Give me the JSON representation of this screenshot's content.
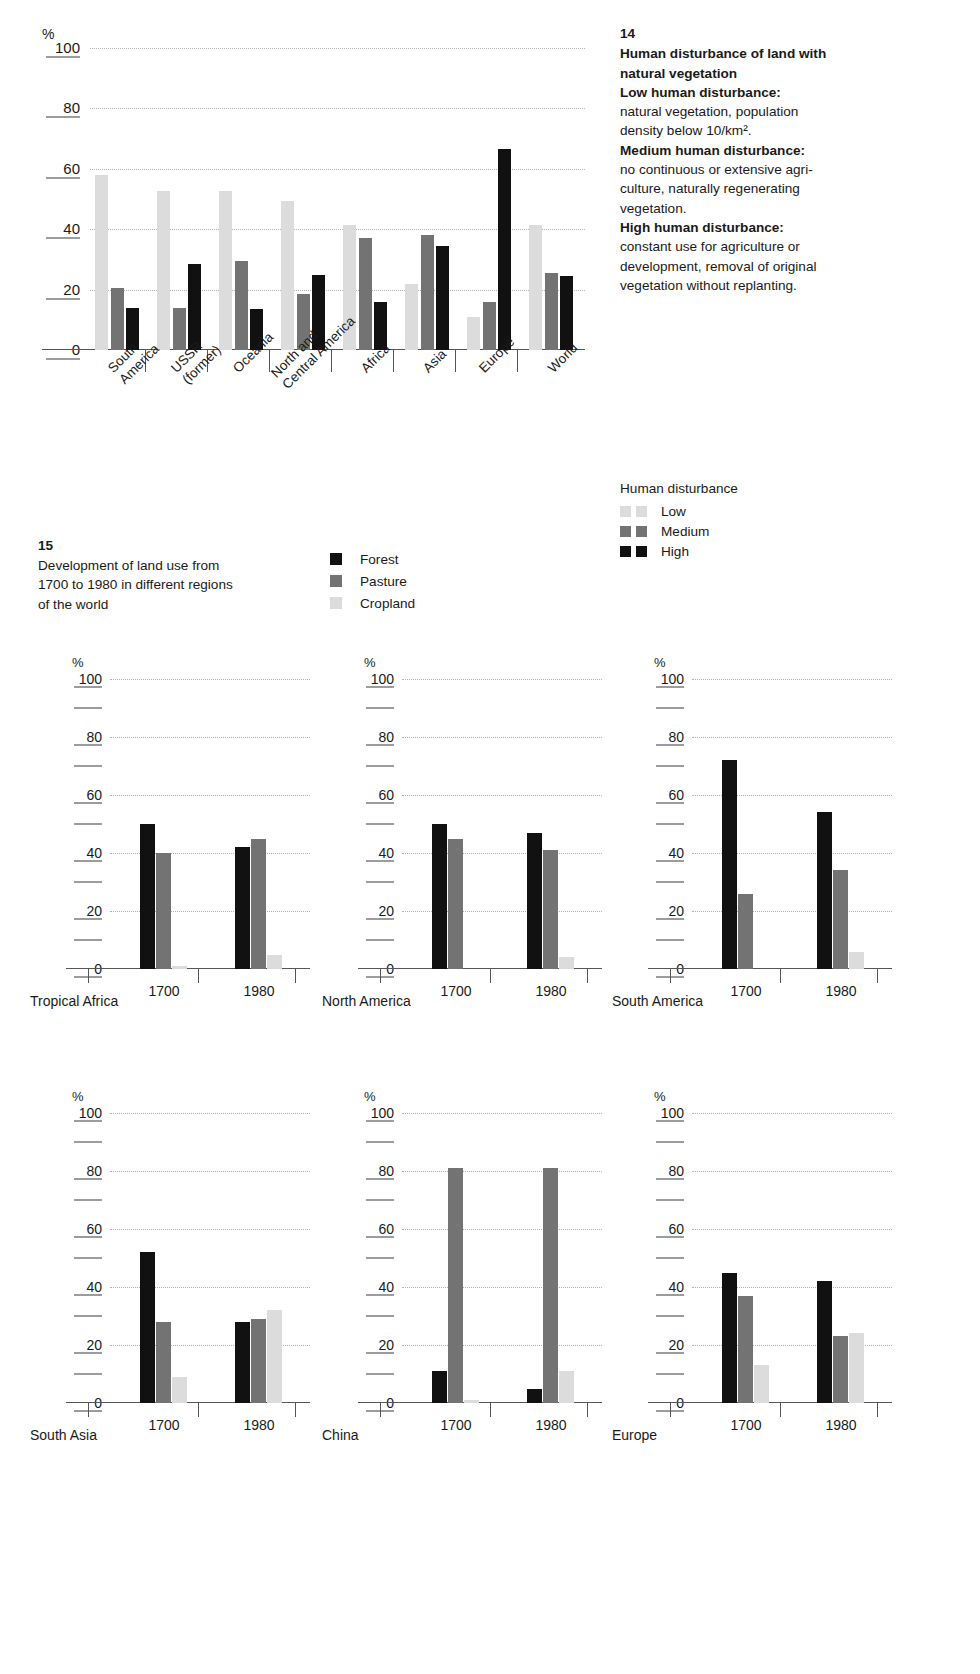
{
  "figure14": {
    "number": "14",
    "title_lines": [
      "Human disturbance of land with",
      "natural vegetation"
    ],
    "defs": [
      {
        "term": "Low human disturbance:",
        "text": "natural vegetation, population density below 10/km²."
      },
      {
        "term": "Medium human disturbance:",
        "text": "no continuous or extensive agri-culture, naturally regenerating vegetation."
      },
      {
        "term": "High human disturbance:",
        "text": "constant use for agriculture or development, removal of original vegetation without replanting."
      }
    ],
    "def_lines": [
      "natural vegetation, population",
      "density below 10/km².",
      "no continuous or extensive agri-",
      "culture, naturally regenerating",
      "vegetation.",
      "constant use for agriculture or",
      "development, removal of original",
      "vegetation without replanting."
    ],
    "legend": {
      "title": "Human disturbance",
      "items": [
        {
          "label": "Low",
          "color": "#dcdcdc"
        },
        {
          "label": "Medium",
          "color": "#737373"
        },
        {
          "label": "High",
          "color": "#111111"
        }
      ]
    },
    "axis_unit": "%"
  },
  "figure15": {
    "number": "15",
    "caption_lines": [
      "Development of land use from",
      "1700 to 1980 in different regions",
      "of the world"
    ],
    "legend": [
      {
        "label": "Forest",
        "color": "#111111"
      },
      {
        "label": "Pasture",
        "color": "#737373"
      },
      {
        "label": "Cropland",
        "color": "#dcdcdc"
      }
    ],
    "axis_unit": "%"
  },
  "chart_data": [
    {
      "id": "fig14",
      "type": "bar",
      "title": "Human disturbance of land with natural vegetation",
      "xlabel": "",
      "ylabel": "%",
      "ylim": [
        0,
        100
      ],
      "yticks": [
        0,
        20,
        40,
        60,
        80,
        100
      ],
      "grid": true,
      "legend_position": "right",
      "categories": [
        "South\nAmerica",
        "USSR\n(former)",
        "Oceania",
        "North and\nCentral America",
        "Africa",
        "Asia",
        "Europe",
        "World"
      ],
      "series": [
        {
          "name": "Low",
          "color": "#dcdcdc",
          "values": [
            58,
            52.5,
            52.5,
            49.5,
            41.5,
            22,
            11,
            41.5
          ]
        },
        {
          "name": "Medium",
          "color": "#737373",
          "values": [
            20.5,
            14,
            29.5,
            18.5,
            37,
            38,
            16,
            25.5
          ]
        },
        {
          "name": "High",
          "color": "#111111",
          "values": [
            14,
            28.5,
            13.5,
            25,
            16,
            34.5,
            66.5,
            24.5
          ]
        }
      ]
    },
    {
      "id": "tropical-africa",
      "type": "bar",
      "title": "Tropical Africa",
      "ylabel": "%",
      "ylim": [
        0,
        100
      ],
      "yticks": [
        0,
        20,
        40,
        60,
        80,
        100
      ],
      "grid": true,
      "categories": [
        "1700",
        "1980"
      ],
      "series": [
        {
          "name": "Forest",
          "color": "#111111",
          "values": [
            50,
            42
          ]
        },
        {
          "name": "Pasture",
          "color": "#737373",
          "values": [
            40,
            45
          ]
        },
        {
          "name": "Cropland",
          "color": "#dcdcdc",
          "values": [
            1,
            5
          ]
        }
      ]
    },
    {
      "id": "north-america",
      "type": "bar",
      "title": "North America",
      "ylabel": "%",
      "ylim": [
        0,
        100
      ],
      "yticks": [
        0,
        20,
        40,
        60,
        80,
        100
      ],
      "grid": true,
      "categories": [
        "1700",
        "1980"
      ],
      "series": [
        {
          "name": "Forest",
          "color": "#111111",
          "values": [
            50,
            47
          ]
        },
        {
          "name": "Pasture",
          "color": "#737373",
          "values": [
            45,
            41
          ]
        },
        {
          "name": "Cropland",
          "color": "#dcdcdc",
          "values": [
            0,
            4
          ]
        }
      ]
    },
    {
      "id": "south-america",
      "type": "bar",
      "title": "South America",
      "ylabel": "%",
      "ylim": [
        0,
        100
      ],
      "yticks": [
        0,
        20,
        40,
        60,
        80,
        100
      ],
      "grid": true,
      "categories": [
        "1700",
        "1980"
      ],
      "series": [
        {
          "name": "Forest",
          "color": "#111111",
          "values": [
            72,
            54
          ]
        },
        {
          "name": "Pasture",
          "color": "#737373",
          "values": [
            26,
            34
          ]
        },
        {
          "name": "Cropland",
          "color": "#dcdcdc",
          "values": [
            0,
            6
          ]
        }
      ]
    },
    {
      "id": "south-asia",
      "type": "bar",
      "title": "South Asia",
      "ylabel": "%",
      "ylim": [
        0,
        100
      ],
      "yticks": [
        0,
        20,
        40,
        60,
        80,
        100
      ],
      "grid": true,
      "categories": [
        "1700",
        "1980"
      ],
      "series": [
        {
          "name": "Forest",
          "color": "#111111",
          "values": [
            52,
            28
          ]
        },
        {
          "name": "Pasture",
          "color": "#737373",
          "values": [
            28,
            29
          ]
        },
        {
          "name": "Cropland",
          "color": "#dcdcdc",
          "values": [
            9,
            32
          ]
        }
      ]
    },
    {
      "id": "china",
      "type": "bar",
      "title": "China",
      "ylabel": "%",
      "ylim": [
        0,
        100
      ],
      "yticks": [
        0,
        20,
        40,
        60,
        80,
        100
      ],
      "grid": true,
      "categories": [
        "1700",
        "1980"
      ],
      "series": [
        {
          "name": "Forest",
          "color": "#111111",
          "values": [
            11,
            5
          ]
        },
        {
          "name": "Pasture",
          "color": "#737373",
          "values": [
            81,
            81
          ]
        },
        {
          "name": "Cropland",
          "color": "#dcdcdc",
          "values": [
            1,
            11
          ]
        }
      ]
    },
    {
      "id": "europe",
      "type": "bar",
      "title": "Europe",
      "ylabel": "%",
      "ylim": [
        0,
        100
      ],
      "yticks": [
        0,
        20,
        40,
        60,
        80,
        100
      ],
      "grid": true,
      "categories": [
        "1700",
        "1980"
      ],
      "series": [
        {
          "name": "Forest",
          "color": "#111111",
          "values": [
            45,
            42
          ]
        },
        {
          "name": "Pasture",
          "color": "#737373",
          "values": [
            37,
            23
          ]
        },
        {
          "name": "Cropland",
          "color": "#dcdcdc",
          "values": [
            13,
            24
          ]
        }
      ]
    }
  ]
}
